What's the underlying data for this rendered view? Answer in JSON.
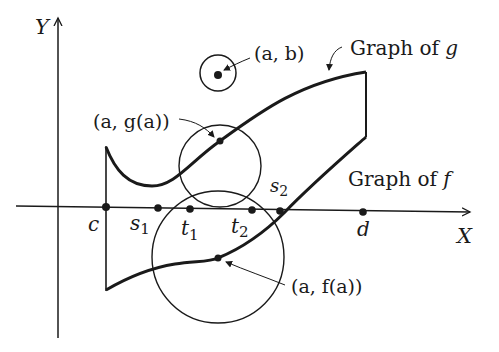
{
  "axes": {
    "x_label": "X",
    "y_label": "Y"
  },
  "points": {
    "c": "c",
    "s1": "s",
    "s1_sub": "1",
    "t1": "t",
    "t1_sub": "1",
    "t2": "t",
    "t2_sub": "2",
    "s2": "s",
    "s2_sub": "2",
    "d": "d"
  },
  "annotations": {
    "ab_label": "(a, b)",
    "aga_label": "(a, g(a))",
    "afa_label": "(a, f(a))",
    "graph_g_text": "Graph of ",
    "graph_g_var": "g",
    "graph_f_text": "Graph of ",
    "graph_f_var": "f"
  },
  "colors": {
    "ink": "#1a1a1a",
    "background": "#ffffff"
  }
}
